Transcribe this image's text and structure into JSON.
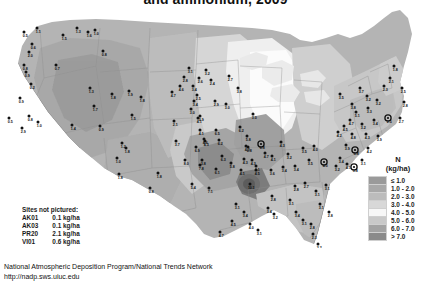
{
  "title": "and ammonium, 2009",
  "legend": {
    "header_line1": "N",
    "header_line2": "(kg/ha)",
    "rows": [
      {
        "label": "≤ 1.0",
        "color": "#9a9a9a"
      },
      {
        "label": "1.0 - 2.0",
        "color": "#a8a8a8"
      },
      {
        "label": "2.0 - 3.0",
        "color": "#bcbcbc"
      },
      {
        "label": "3.0 - 4.0",
        "color": "#d8d8d8"
      },
      {
        "label": "4.0 - 5.0",
        "color": "#f7f7f7"
      },
      {
        "label": "5.0 - 6.0",
        "color": "#c9c9c9"
      },
      {
        "label": "6.0 - 7.0",
        "color": "#a3a3a3"
      },
      {
        "label": "> 7.0",
        "color": "#8a8a8a"
      }
    ]
  },
  "sites_not_pictured": {
    "heading": "Sites not pictured:",
    "rows": [
      {
        "code": "AK01",
        "value": "0.1 kg/ha"
      },
      {
        "code": "AK03",
        "value": "0.1 kg/ha"
      },
      {
        "code": "PR20",
        "value": "2.1 kg/ha"
      },
      {
        "code": "VI01",
        "value": "0.6 kg/ha"
      }
    ]
  },
  "footer": {
    "line1": "National Atmospheric Deposition Program/National Trends Network",
    "line2": "http://nadp.sws.uiuc.edu"
  },
  "chart_data": {
    "type": "heatmap",
    "title": "and ammonium, 2009",
    "subtitle": "",
    "unit": "kg/ha",
    "variable": "N",
    "grid": false,
    "legend_position": "right",
    "bins": [
      {
        "label": "≤ 1.0",
        "min": null,
        "max": 1.0,
        "color": "#9a9a9a"
      },
      {
        "label": "1.0 - 2.0",
        "min": 1.0,
        "max": 2.0,
        "color": "#a8a8a8"
      },
      {
        "label": "2.0 - 3.0",
        "min": 2.0,
        "max": 3.0,
        "color": "#bcbcbc"
      },
      {
        "label": "3.0 - 4.0",
        "min": 3.0,
        "max": 4.0,
        "color": "#d8d8d8"
      },
      {
        "label": "4.0 - 5.0",
        "min": 4.0,
        "max": 5.0,
        "color": "#f7f7f7"
      },
      {
        "label": "5.0 - 6.0",
        "min": 5.0,
        "max": 6.0,
        "color": "#c9c9c9"
      },
      {
        "label": "6.0 - 7.0",
        "min": 6.0,
        "max": 7.0,
        "color": "#a3a3a3"
      },
      {
        "label": "> 7.0",
        "min": 7.0,
        "max": null,
        "color": "#8a8a8a"
      }
    ],
    "sites_not_pictured": [
      {
        "code": "AK01",
        "value": 0.1
      },
      {
        "code": "AK03",
        "value": 0.1
      },
      {
        "code": "PR20",
        "value": 2.1
      },
      {
        "code": "VI01",
        "value": 0.6
      }
    ],
    "sites": [
      {
        "x": 24,
        "y": 24,
        "v": "0.5",
        "ring": false
      },
      {
        "x": 37,
        "y": 20,
        "v": "1.1",
        "ring": false
      },
      {
        "x": 32,
        "y": 36,
        "v": "0.6",
        "ring": false
      },
      {
        "x": 29,
        "y": 44,
        "v": "2.0",
        "ring": false
      },
      {
        "x": 63,
        "y": 27,
        "v": "1.5",
        "ring": false
      },
      {
        "x": 88,
        "y": 24,
        "v": "1.6",
        "ring": false
      },
      {
        "x": 77,
        "y": 20,
        "v": "1.3",
        "ring": false
      },
      {
        "x": 95,
        "y": 22,
        "v": "1.0",
        "ring": false
      },
      {
        "x": 24,
        "y": 57,
        "v": "0.8",
        "ring": false
      },
      {
        "x": 26,
        "y": 64,
        "v": "0.9",
        "ring": false
      },
      {
        "x": 31,
        "y": 76,
        "v": "0.2",
        "ring": false
      },
      {
        "x": 56,
        "y": 57,
        "v": "0.7",
        "ring": false
      },
      {
        "x": 103,
        "y": 43,
        "v": "0.8",
        "ring": false
      },
      {
        "x": 90,
        "y": 80,
        "v": "1.3",
        "ring": false
      },
      {
        "x": 94,
        "y": 98,
        "v": "1.7",
        "ring": false
      },
      {
        "x": 20,
        "y": 90,
        "v": "0.9",
        "ring": false
      },
      {
        "x": 9,
        "y": 110,
        "v": "0.5",
        "ring": false
      },
      {
        "x": 22,
        "y": 120,
        "v": "2.9",
        "ring": false
      },
      {
        "x": 29,
        "y": 108,
        "v": "0.8",
        "ring": false
      },
      {
        "x": 38,
        "y": 114,
        "v": "1.0",
        "ring": false
      },
      {
        "x": 72,
        "y": 117,
        "v": "1.4",
        "ring": false
      },
      {
        "x": 100,
        "y": 118,
        "v": "0.9",
        "ring": false
      },
      {
        "x": 122,
        "y": 135,
        "v": "1.2",
        "ring": false
      },
      {
        "x": 117,
        "y": 150,
        "v": "1.0",
        "ring": false
      },
      {
        "x": 119,
        "y": 166,
        "v": "1.8",
        "ring": false
      },
      {
        "x": 132,
        "y": 107,
        "v": "1.5",
        "ring": false
      },
      {
        "x": 126,
        "y": 140,
        "v": "1.8",
        "ring": false
      },
      {
        "x": 150,
        "y": 180,
        "v": "0.8",
        "ring": false
      },
      {
        "x": 158,
        "y": 165,
        "v": "1.8",
        "ring": false
      },
      {
        "x": 112,
        "y": 86,
        "v": "1.8",
        "ring": false
      },
      {
        "x": 129,
        "y": 83,
        "v": "1.9",
        "ring": false
      },
      {
        "x": 141,
        "y": 89,
        "v": "1.8",
        "ring": false
      },
      {
        "x": 172,
        "y": 84,
        "v": "4.7",
        "ring": false
      },
      {
        "x": 174,
        "y": 113,
        "v": "2.1",
        "ring": false
      },
      {
        "x": 176,
        "y": 133,
        "v": "3.7",
        "ring": false
      },
      {
        "x": 200,
        "y": 108,
        "v": "3.9",
        "ring": false
      },
      {
        "x": 205,
        "y": 133,
        "v": "4.3",
        "ring": false
      },
      {
        "x": 202,
        "y": 152,
        "v": "3.8",
        "ring": false
      },
      {
        "x": 206,
        "y": 62,
        "v": "3.2",
        "ring": false
      },
      {
        "x": 199,
        "y": 70,
        "v": "2.6",
        "ring": false
      },
      {
        "x": 189,
        "y": 60,
        "v": "3.1",
        "ring": false
      },
      {
        "x": 184,
        "y": 69,
        "v": "2.8",
        "ring": false
      },
      {
        "x": 180,
        "y": 78,
        "v": "4.6",
        "ring": false
      },
      {
        "x": 193,
        "y": 78,
        "v": "3.4",
        "ring": false
      },
      {
        "x": 197,
        "y": 87,
        "v": "2.5",
        "ring": false
      },
      {
        "x": 211,
        "y": 72,
        "v": "2.4",
        "ring": false
      },
      {
        "x": 229,
        "y": 68,
        "v": "2.7",
        "ring": false
      },
      {
        "x": 238,
        "y": 80,
        "v": "3.8",
        "ring": false
      },
      {
        "x": 215,
        "y": 93,
        "v": "2.9",
        "ring": false
      },
      {
        "x": 226,
        "y": 96,
        "v": "3.0",
        "ring": false
      },
      {
        "x": 194,
        "y": 93,
        "v": "3.4",
        "ring": false
      },
      {
        "x": 191,
        "y": 101,
        "v": "3.0",
        "ring": false
      },
      {
        "x": 198,
        "y": 110,
        "v": "4.1",
        "ring": false
      },
      {
        "x": 200,
        "y": 122,
        "v": "4.1",
        "ring": false
      },
      {
        "x": 204,
        "y": 131,
        "v": "4.6",
        "ring": false
      },
      {
        "x": 196,
        "y": 139,
        "v": "6.9",
        "ring": false
      },
      {
        "x": 216,
        "y": 122,
        "v": "6.5",
        "ring": false
      },
      {
        "x": 219,
        "y": 132,
        "v": "6.2",
        "ring": false
      },
      {
        "x": 240,
        "y": 119,
        "v": "6.2",
        "ring": false
      },
      {
        "x": 247,
        "y": 128,
        "v": "5.8",
        "ring": false
      },
      {
        "x": 253,
        "y": 106,
        "v": "3.0",
        "ring": false
      },
      {
        "x": 222,
        "y": 148,
        "v": "6.3",
        "ring": false
      },
      {
        "x": 200,
        "y": 157,
        "v": "7.8",
        "ring": false
      },
      {
        "x": 185,
        "y": 152,
        "v": "8.0",
        "ring": false
      },
      {
        "x": 216,
        "y": 161,
        "v": "6.1",
        "ring": false
      },
      {
        "x": 231,
        "y": 155,
        "v": "5.8",
        "ring": false
      },
      {
        "x": 244,
        "y": 151,
        "v": "4.3",
        "ring": false
      },
      {
        "x": 241,
        "y": 162,
        "v": "4.1",
        "ring": false
      },
      {
        "x": 256,
        "y": 158,
        "v": "3.1",
        "ring": false
      },
      {
        "x": 192,
        "y": 176,
        "v": "5.4",
        "ring": false
      },
      {
        "x": 209,
        "y": 180,
        "v": "7.1",
        "ring": false
      },
      {
        "x": 248,
        "y": 139,
        "v": "6.8",
        "ring": false
      },
      {
        "x": 265,
        "y": 145,
        "v": "4.7",
        "ring": false
      },
      {
        "x": 272,
        "y": 148,
        "v": "4.1",
        "ring": false
      },
      {
        "x": 261,
        "y": 136,
        "v": "6.8",
        "ring": true
      },
      {
        "x": 281,
        "y": 134,
        "v": "4.3",
        "ring": false
      },
      {
        "x": 288,
        "y": 146,
        "v": "3.2",
        "ring": false
      },
      {
        "x": 303,
        "y": 140,
        "v": "3.5",
        "ring": false
      },
      {
        "x": 314,
        "y": 138,
        "v": "4.0",
        "ring": false
      },
      {
        "x": 252,
        "y": 152,
        "v": "4.3",
        "ring": false
      },
      {
        "x": 256,
        "y": 162,
        "v": "4.5",
        "ring": false
      },
      {
        "x": 271,
        "y": 162,
        "v": "3.6",
        "ring": false
      },
      {
        "x": 283,
        "y": 159,
        "v": "3.4",
        "ring": false
      },
      {
        "x": 295,
        "y": 158,
        "v": "3.4",
        "ring": false
      },
      {
        "x": 309,
        "y": 152,
        "v": "3.5",
        "ring": false
      },
      {
        "x": 324,
        "y": 154,
        "v": "4.0",
        "ring": true
      },
      {
        "x": 246,
        "y": 138,
        "v": "4.3",
        "ring": false
      },
      {
        "x": 250,
        "y": 176,
        "v": "10.3",
        "ring": false
      },
      {
        "x": 272,
        "y": 188,
        "v": "2.8",
        "ring": false
      },
      {
        "x": 268,
        "y": 200,
        "v": "3.4",
        "ring": false
      },
      {
        "x": 274,
        "y": 206,
        "v": "3.2",
        "ring": false
      },
      {
        "x": 290,
        "y": 192,
        "v": "3.1",
        "ring": false
      },
      {
        "x": 295,
        "y": 178,
        "v": "2.8",
        "ring": false
      },
      {
        "x": 305,
        "y": 175,
        "v": "2.7",
        "ring": false
      },
      {
        "x": 316,
        "y": 183,
        "v": "3.1",
        "ring": false
      },
      {
        "x": 326,
        "y": 177,
        "v": "3.1",
        "ring": false
      },
      {
        "x": 320,
        "y": 196,
        "v": "3.1",
        "ring": false
      },
      {
        "x": 329,
        "y": 204,
        "v": "2.8",
        "ring": false
      },
      {
        "x": 236,
        "y": 196,
        "v": "3.1",
        "ring": false
      },
      {
        "x": 244,
        "y": 204,
        "v": "3.4",
        "ring": false
      },
      {
        "x": 250,
        "y": 216,
        "v": "4.0",
        "ring": false
      },
      {
        "x": 232,
        "y": 213,
        "v": "4.5",
        "ring": false
      },
      {
        "x": 258,
        "y": 222,
        "v": "3.1",
        "ring": false
      },
      {
        "x": 220,
        "y": 224,
        "v": "4.7",
        "ring": false
      },
      {
        "x": 296,
        "y": 204,
        "v": "3.4",
        "ring": false
      },
      {
        "x": 303,
        "y": 212,
        "v": "3.1",
        "ring": false
      },
      {
        "x": 311,
        "y": 216,
        "v": "2.8",
        "ring": false
      },
      {
        "x": 313,
        "y": 226,
        "v": "2.3",
        "ring": false
      },
      {
        "x": 318,
        "y": 236,
        "v": "3.2",
        "ring": false
      },
      {
        "x": 340,
        "y": 86,
        "v": "3.5",
        "ring": false
      },
      {
        "x": 352,
        "y": 96,
        "v": "3.8",
        "ring": false
      },
      {
        "x": 360,
        "y": 80,
        "v": "3.7",
        "ring": false
      },
      {
        "x": 367,
        "y": 88,
        "v": "3.2",
        "ring": false
      },
      {
        "x": 356,
        "y": 104,
        "v": "5.1",
        "ring": false
      },
      {
        "x": 368,
        "y": 100,
        "v": "3.3",
        "ring": false
      },
      {
        "x": 377,
        "y": 92,
        "v": "3.2",
        "ring": false
      },
      {
        "x": 384,
        "y": 78,
        "v": "2.3",
        "ring": false
      },
      {
        "x": 390,
        "y": 70,
        "v": "2.1",
        "ring": false
      },
      {
        "x": 394,
        "y": 58,
        "v": "1.8",
        "ring": false
      },
      {
        "x": 402,
        "y": 80,
        "v": "2.5",
        "ring": false
      },
      {
        "x": 404,
        "y": 94,
        "v": "2.8",
        "ring": false
      },
      {
        "x": 400,
        "y": 110,
        "v": "2.7",
        "ring": false
      },
      {
        "x": 388,
        "y": 110,
        "v": "2.5",
        "ring": true
      },
      {
        "x": 374,
        "y": 112,
        "v": "3.4",
        "ring": false
      },
      {
        "x": 362,
        "y": 116,
        "v": "3.2",
        "ring": false
      },
      {
        "x": 350,
        "y": 112,
        "v": "4.7",
        "ring": false
      },
      {
        "x": 344,
        "y": 118,
        "v": "4.5",
        "ring": false
      },
      {
        "x": 338,
        "y": 124,
        "v": "4.2",
        "ring": false
      },
      {
        "x": 352,
        "y": 126,
        "v": "4.8",
        "ring": false
      },
      {
        "x": 366,
        "y": 126,
        "v": "4.3",
        "ring": false
      },
      {
        "x": 378,
        "y": 128,
        "v": "3.9",
        "ring": false
      },
      {
        "x": 346,
        "y": 137,
        "v": "3.9",
        "ring": false
      },
      {
        "x": 355,
        "y": 142,
        "v": "5.8",
        "ring": true
      },
      {
        "x": 368,
        "y": 140,
        "v": "4.2",
        "ring": false
      },
      {
        "x": 340,
        "y": 150,
        "v": "3.4",
        "ring": false
      },
      {
        "x": 347,
        "y": 156,
        "v": "4.1",
        "ring": false
      },
      {
        "x": 354,
        "y": 159,
        "v": "3.8",
        "ring": true
      },
      {
        "x": 362,
        "y": 152,
        "v": "3.1",
        "ring": false
      },
      {
        "x": 336,
        "y": 158,
        "v": "3.2",
        "ring": false
      }
    ]
  }
}
